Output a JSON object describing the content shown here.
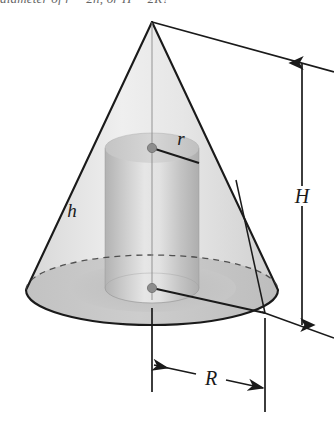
{
  "figure": {
    "kind": "geometry-diagram",
    "caption_clipped": "diameter of r = 2h, or H = 2R?",
    "labels": {
      "cylinder_radius": "r",
      "cylinder_height": "h",
      "cone_height": "H",
      "cone_radius": "R"
    },
    "colors": {
      "outline": "#1a1a1a",
      "cone_upper_fill": "#e9e9e9",
      "cone_base_fill": "#c6c6c6",
      "cone_base_inner_fill": "#b9b9b9",
      "cylinder_fill_light": "#e2e2e2",
      "cylinder_fill_dark": "#b4b4b4",
      "cylinder_top_fill": "#cfcfcf",
      "dimension_line": "#1a1a1a",
      "center_dot": "#8d8d8d",
      "page_background": "#ffffff"
    },
    "geometry": {
      "apex": [
        152,
        22
      ],
      "cone_base_center": [
        152,
        290
      ],
      "cone_base_radius_x": 126,
      "cone_base_radius_y": 35,
      "cylinder_top_center": [
        152,
        148
      ],
      "cylinder_bottom_center": [
        152,
        288
      ],
      "cylinder_radius_x": 47,
      "cylinder_radius_y": 15,
      "height_dimension_x": 302,
      "height_dimension_top_y": 62,
      "height_dimension_bottom_y": 326,
      "radius_dimension_y": 366,
      "radius_dimension_left_x": 152,
      "radius_dimension_right_x": 265
    }
  }
}
